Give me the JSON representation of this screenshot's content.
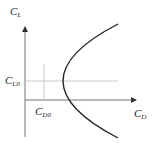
{
  "diagram": {
    "type": "drag-polar",
    "y_axis": {
      "label": "C",
      "sub": "L"
    },
    "x_axis": {
      "label": "C",
      "sub": "D"
    },
    "markers": {
      "cl0": {
        "label": "C",
        "sub": "L0"
      },
      "cd0": {
        "label": "C",
        "sub": "D0"
      }
    },
    "colors": {
      "axis": "#555555",
      "curve": "#222222",
      "guide": "#bbbbbb"
    }
  }
}
